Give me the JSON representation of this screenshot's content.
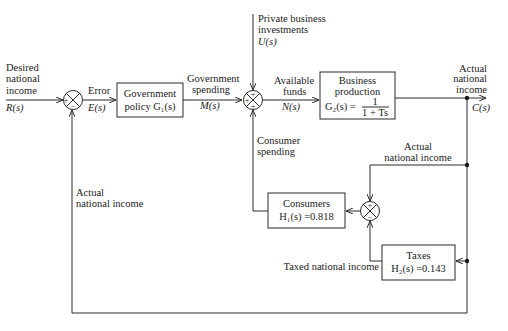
{
  "diagram": {
    "type": "block-diagram",
    "inputs": {
      "desired": {
        "line1": "Desired",
        "line2": "national",
        "line3": "income",
        "signal": "R(s)"
      },
      "private_investment": {
        "line1": "Private business",
        "line2": "investments",
        "signal": "U(s)"
      }
    },
    "signals": {
      "error": {
        "label": "Error",
        "signal": "E(s)"
      },
      "gov_spending": {
        "line1": "Government",
        "line2": "spending",
        "signal": "M(s)"
      },
      "available_funds": {
        "line1": "Available",
        "line2": "funds",
        "signal": "N(s)"
      },
      "output": {
        "line1": "Actual",
        "line2": "national",
        "line3": "income",
        "signal": "C(s)"
      },
      "consumer_spending": {
        "line1": "Consumer",
        "line2": "spending"
      },
      "actual_income_inner": {
        "line1": "Actual",
        "line2": "national income"
      },
      "taxed_income": {
        "label": "Taxed national income"
      },
      "actual_income_feedback": {
        "line1": "Actual",
        "line2": "national income"
      }
    },
    "blocks": {
      "government": {
        "line1": "Government",
        "line2": "policy  G₁(s)"
      },
      "business": {
        "line1": "Business",
        "line2": "production",
        "lhs": "G₂(s) =",
        "num": "1",
        "den": "1 + Ts"
      },
      "consumers": {
        "line1": "Consumers",
        "line2": "H₁(s) =0.818"
      },
      "taxes": {
        "line1": "Taxes",
        "line2": "H₂(s) =0.143"
      }
    },
    "summing_junctions": {
      "sj1": {
        "left": "+",
        "bottom": "−"
      },
      "sj2": {
        "top": "+",
        "left": "+",
        "bottom": "+"
      },
      "sj3": {
        "top": "+",
        "bottom": "−"
      }
    }
  }
}
